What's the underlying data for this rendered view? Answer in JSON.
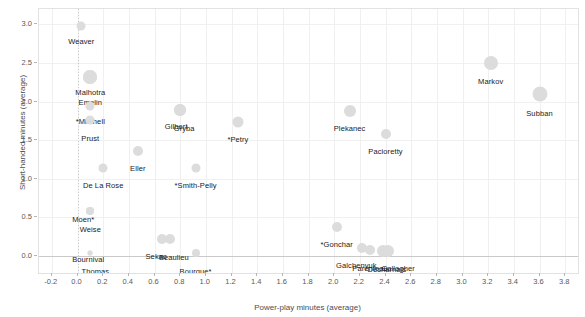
{
  "chart_data": {
    "type": "scatter",
    "title": "",
    "xlabel": "Power-play minutes (average)",
    "ylabel": "Short-handed minutes (average)",
    "xlim": [
      -0.3,
      3.9
    ],
    "ylim": [
      -0.22,
      3.2
    ],
    "xticks": [
      "-0.2",
      "0.0",
      "0.2",
      "0.4",
      "0.6",
      "0.8",
      "1.0",
      "1.2",
      "1.4",
      "1.6",
      "1.8",
      "2.0",
      "2.2",
      "2.4",
      "2.6",
      "2.8",
      "3.0",
      "3.2",
      "3.4",
      "3.6",
      "3.8"
    ],
    "xtick_values": [
      -0.2,
      0.0,
      0.2,
      0.4,
      0.6,
      0.8,
      1.0,
      1.2,
      1.4,
      1.6,
      1.8,
      2.0,
      2.2,
      2.4,
      2.6,
      2.8,
      3.0,
      3.2,
      3.4,
      3.6,
      3.8
    ],
    "yticks": [
      "0.0",
      "0.5",
      "1.0",
      "1.5",
      "2.0",
      "2.5",
      "3.0"
    ],
    "ytick_values": [
      0.0,
      0.5,
      1.0,
      1.5,
      2.0,
      2.5,
      3.0
    ],
    "grid": true,
    "legend": "none",
    "point_color": "#dcdcdc",
    "label_color": "#1a1a1a",
    "reference_lines": {
      "x": 0.0,
      "y": 0.0
    },
    "points": [
      {
        "label": "Weaver",
        "x": 0.03,
        "y": 2.98,
        "size": 9,
        "label_dx": 0,
        "label_dy": 11
      },
      {
        "label": "Malhotra",
        "x": 0.1,
        "y": 2.32,
        "size": 14,
        "label_dx": 0,
        "label_dy": 11
      },
      {
        "label": "Emelin",
        "x": 0.1,
        "y": 2.32,
        "size": 14,
        "label_dx": 0,
        "label_dy": 21
      },
      {
        "label": "*Mitchell",
        "x": 0.1,
        "y": 1.95,
        "size": 9,
        "label_dx": 0,
        "label_dy": 11
      },
      {
        "label": "Prust",
        "x": 0.1,
        "y": 1.76,
        "size": 9,
        "label_dx": 0,
        "label_dy": 14
      },
      {
        "label": "Gilbert",
        "x": 0.8,
        "y": 1.89,
        "size": 12,
        "label_dx": -4,
        "label_dy": 12
      },
      {
        "label": "Gryba",
        "x": 0.8,
        "y": 1.89,
        "size": 12,
        "label_dx": 4,
        "label_dy": 14
      },
      {
        "label": "*Petry",
        "x": 1.25,
        "y": 1.74,
        "size": 11,
        "label_dx": 0,
        "label_dy": 13
      },
      {
        "label": "Plekanec",
        "x": 2.12,
        "y": 1.88,
        "size": 12,
        "label_dx": 0,
        "label_dy": 13
      },
      {
        "label": "Pacioretty",
        "x": 2.4,
        "y": 1.58,
        "size": 10,
        "label_dx": 0,
        "label_dy": 13
      },
      {
        "label": "Markov",
        "x": 3.22,
        "y": 2.5,
        "size": 14,
        "label_dx": 0,
        "label_dy": 14
      },
      {
        "label": "Subban",
        "x": 3.6,
        "y": 2.1,
        "size": 15,
        "label_dx": 0,
        "label_dy": 15
      },
      {
        "label": "Eller",
        "x": 0.47,
        "y": 1.36,
        "size": 10,
        "label_dx": 0,
        "label_dy": 13
      },
      {
        "label": "De La Rose",
        "x": 0.2,
        "y": 1.14,
        "size": 9,
        "label_dx": 0,
        "label_dy": 13
      },
      {
        "label": "*Smith-Pelly",
        "x": 0.92,
        "y": 1.14,
        "size": 9,
        "label_dx": 0,
        "label_dy": 13
      },
      {
        "label": "Moen*",
        "x": 0.1,
        "y": 0.58,
        "size": 8,
        "label_dx": -7,
        "label_dy": 4
      },
      {
        "label": "Weise",
        "x": 0.1,
        "y": 0.58,
        "size": 8,
        "label_dx": 0,
        "label_dy": 14
      },
      {
        "label": "Bournival",
        "x": 0.1,
        "y": 0.04,
        "size": 5,
        "label_dx": -2,
        "label_dy": 2
      },
      {
        "label": "Thomas",
        "x": 0.1,
        "y": 0.04,
        "size": 5,
        "label_dx": 5,
        "label_dy": 14
      },
      {
        "label": "Sekac",
        "x": 0.66,
        "y": 0.22,
        "size": 10,
        "label_dx": -6,
        "label_dy": 13
      },
      {
        "label": "Beaulieu",
        "x": 0.72,
        "y": 0.22,
        "size": 10,
        "label_dx": 4,
        "label_dy": 14
      },
      {
        "label": "Bourque*",
        "x": 0.92,
        "y": 0.04,
        "size": 8,
        "label_dx": 0,
        "label_dy": 14
      },
      {
        "label": "*Gonchar",
        "x": 2.02,
        "y": 0.38,
        "size": 10,
        "label_dx": 0,
        "label_dy": 13
      },
      {
        "label": "Galchenyuk",
        "x": 2.22,
        "y": 0.1,
        "size": 10,
        "label_dx": -6,
        "label_dy": 13
      },
      {
        "label": "Parenteau",
        "x": 2.28,
        "y": 0.08,
        "size": 10,
        "label_dx": 0,
        "label_dy": 14
      },
      {
        "label": "Desharnais",
        "x": 2.38,
        "y": 0.07,
        "size": 12,
        "label_dx": 4,
        "label_dy": 14
      },
      {
        "label": "Gallagher",
        "x": 2.42,
        "y": 0.06,
        "size": 12,
        "label_dx": 10,
        "label_dy": 13
      }
    ]
  }
}
